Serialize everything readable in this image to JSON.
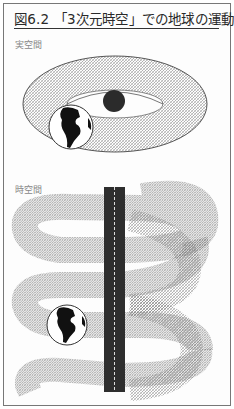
{
  "figure": {
    "title": "図6.2 「3次元時空」での地球の運動",
    "panels": [
      {
        "label": "実空間",
        "description": "torus-shaped orbit of the Earth around the Sun"
      },
      {
        "label": "時空間",
        "description": "helical world-line of the Earth around the Sun's vertical world-line"
      }
    ]
  },
  "colors": {
    "line": "#555555",
    "sun": "#2b2b2b",
    "timeline": "#2e2e2e",
    "border": "#777777"
  }
}
